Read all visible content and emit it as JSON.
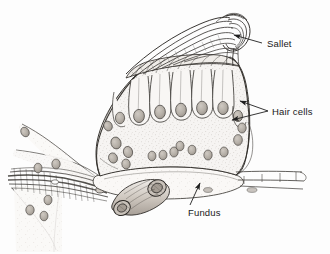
{
  "figure": {
    "type": "anatomical-line-drawing",
    "background_color": "#fdfdfd",
    "ink_color": "#2b2b2b",
    "fill_color": "#f4f2f0",
    "nucleus_color": "#b9b4ae",
    "width": 330,
    "height": 254
  },
  "labels": [
    {
      "id": "sallet",
      "text": "Sallet",
      "x": 267,
      "y": 47,
      "leader": "arrow",
      "target_x": 232,
      "target_y": 35
    },
    {
      "id": "hair_cells",
      "text": "Hair cells",
      "x": 272,
      "y": 115,
      "leader": "bracket",
      "target_x": 232,
      "target_y": 103
    },
    {
      "id": "fundus",
      "text": "Fundus",
      "x": 188,
      "y": 213,
      "leader": "arrow",
      "target_x": 197,
      "target_y": 182
    }
  ],
  "structures": [
    {
      "id": "sallet-fibers",
      "name": "Sallet",
      "description": "fan of curved converging fibers at upper right"
    },
    {
      "id": "hair-cell-row",
      "name": "Hair cells",
      "description": "row of columnar sensory cells with oval nuclei"
    },
    {
      "id": "fundus-body",
      "name": "Fundus",
      "description": "basal body of the organ"
    },
    {
      "id": "nerve-bundle",
      "name": "Nerve bundle",
      "description": "fibers entering from lower left"
    },
    {
      "id": "tubular-organ",
      "name": "Tubular organ",
      "description": "cut cylindrical structure at lower centre"
    }
  ]
}
